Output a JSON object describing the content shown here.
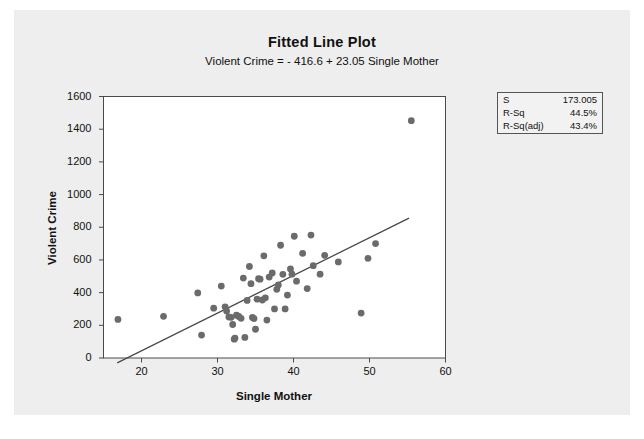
{
  "chart_data": {
    "type": "scatter",
    "title": "Fitted Line Plot",
    "subtitle": "Violent Crime =  - 416.6 + 23.05 Single Mother",
    "xlabel": "Single Mother",
    "ylabel": "Violent Crime",
    "xlim": [
      15,
      60
    ],
    "ylim": [
      0,
      1600
    ],
    "xticks": [
      20,
      30,
      40,
      50,
      60
    ],
    "yticks": [
      0,
      200,
      400,
      600,
      800,
      1000,
      1200,
      1400,
      1600
    ],
    "grid": false,
    "legend": "none",
    "point_color": "#6b6b6b",
    "line_color": "#4a4a4a",
    "fit_line": {
      "intercept": -416.6,
      "slope": 23.05,
      "x_start": 16.8,
      "x_end": 55.2
    },
    "points": [
      {
        "x": 16.9,
        "y": 236
      },
      {
        "x": 22.9,
        "y": 255
      },
      {
        "x": 27.4,
        "y": 398
      },
      {
        "x": 27.9,
        "y": 140
      },
      {
        "x": 29.5,
        "y": 305
      },
      {
        "x": 30.5,
        "y": 440
      },
      {
        "x": 31.0,
        "y": 313
      },
      {
        "x": 31.2,
        "y": 287
      },
      {
        "x": 31.5,
        "y": 251
      },
      {
        "x": 31.8,
        "y": 249
      },
      {
        "x": 32.0,
        "y": 205
      },
      {
        "x": 32.2,
        "y": 115
      },
      {
        "x": 32.3,
        "y": 122
      },
      {
        "x": 32.5,
        "y": 262
      },
      {
        "x": 32.8,
        "y": 254
      },
      {
        "x": 33.1,
        "y": 243
      },
      {
        "x": 33.4,
        "y": 489
      },
      {
        "x": 33.6,
        "y": 126
      },
      {
        "x": 33.9,
        "y": 352
      },
      {
        "x": 34.2,
        "y": 560
      },
      {
        "x": 34.4,
        "y": 455
      },
      {
        "x": 34.6,
        "y": 248
      },
      {
        "x": 34.8,
        "y": 241
      },
      {
        "x": 35.0,
        "y": 176
      },
      {
        "x": 35.2,
        "y": 360
      },
      {
        "x": 35.4,
        "y": 485
      },
      {
        "x": 35.6,
        "y": 482
      },
      {
        "x": 35.9,
        "y": 355
      },
      {
        "x": 36.1,
        "y": 625
      },
      {
        "x": 36.3,
        "y": 368
      },
      {
        "x": 36.5,
        "y": 232
      },
      {
        "x": 36.8,
        "y": 495
      },
      {
        "x": 37.2,
        "y": 520
      },
      {
        "x": 37.5,
        "y": 300
      },
      {
        "x": 37.8,
        "y": 420
      },
      {
        "x": 38.0,
        "y": 447
      },
      {
        "x": 38.3,
        "y": 690
      },
      {
        "x": 38.6,
        "y": 512
      },
      {
        "x": 38.9,
        "y": 300
      },
      {
        "x": 39.2,
        "y": 385
      },
      {
        "x": 39.6,
        "y": 545
      },
      {
        "x": 39.8,
        "y": 513
      },
      {
        "x": 40.1,
        "y": 745
      },
      {
        "x": 40.4,
        "y": 470
      },
      {
        "x": 41.2,
        "y": 640
      },
      {
        "x": 41.8,
        "y": 425
      },
      {
        "x": 42.3,
        "y": 752
      },
      {
        "x": 42.6,
        "y": 565
      },
      {
        "x": 43.5,
        "y": 513
      },
      {
        "x": 44.1,
        "y": 628
      },
      {
        "x": 45.9,
        "y": 588
      },
      {
        "x": 48.9,
        "y": 275
      },
      {
        "x": 49.8,
        "y": 610
      },
      {
        "x": 50.8,
        "y": 700
      },
      {
        "x": 55.5,
        "y": 1452
      }
    ],
    "stats": [
      {
        "label": "S",
        "value": "173.005"
      },
      {
        "label": "R-Sq",
        "value": "44.5%"
      },
      {
        "label": "R-Sq(adj)",
        "value": "43.4%"
      }
    ]
  }
}
